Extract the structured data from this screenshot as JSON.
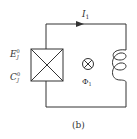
{
  "diagram": {
    "caption": "(b)",
    "current_label": "I",
    "current_sub": "1",
    "junction_energy_label": "E",
    "junction_energy_sub": "J",
    "junction_energy_sup": "0",
    "junction_cap_label": "C",
    "junction_cap_sub": "J",
    "junction_cap_sup": "0",
    "flux_label": "Φ",
    "flux_sub": "1",
    "colors": {
      "stroke": "#333333",
      "background": "#ffffff"
    }
  }
}
